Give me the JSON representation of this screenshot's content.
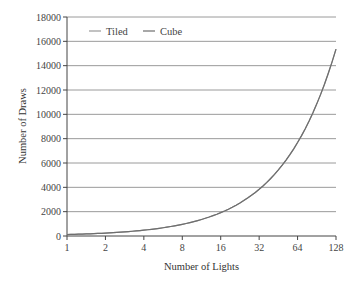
{
  "chart_data": {
    "type": "line",
    "title": "",
    "xlabel": "Number of Lights",
    "ylabel": "Number of Draws",
    "x_scale": "log2",
    "categories": [
      "1",
      "2",
      "4",
      "8",
      "16",
      "32",
      "64",
      "128"
    ],
    "x": [
      1,
      2,
      4,
      8,
      16,
      32,
      64,
      128
    ],
    "series": [
      {
        "name": "Tiled",
        "color": "#9a9a9a",
        "values": [
          120,
          240,
          480,
          960,
          1920,
          3840,
          7680,
          15360
        ]
      },
      {
        "name": "Cube",
        "color": "#6e6e6e",
        "values": [
          120,
          240,
          480,
          960,
          1920,
          3840,
          7680,
          15360
        ]
      }
    ],
    "ylim": [
      0,
      18000
    ],
    "yticks": [
      0,
      2000,
      4000,
      6000,
      8000,
      10000,
      12000,
      14000,
      16000,
      18000
    ],
    "grid": true,
    "legend_position": "top-left-inside"
  },
  "legend": {
    "items": [
      {
        "label": "Tiled",
        "color": "#9a9a9a"
      },
      {
        "label": "Cube",
        "color": "#6e6e6e"
      }
    ]
  },
  "axes": {
    "xlabel": "Number of Lights",
    "ylabel": "Number of Draws"
  }
}
